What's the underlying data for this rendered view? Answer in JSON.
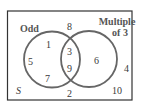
{
  "diagram": {
    "type": "venn",
    "universe_label": "S",
    "sets": [
      {
        "name": "Odd",
        "label": "Odd"
      },
      {
        "name": "Multiple of 3",
        "label_line1": "Multiple",
        "label_line2": "of 3"
      }
    ],
    "regions": {
      "odd_only": [
        "1",
        "5",
        "7"
      ],
      "both": [
        "3",
        "9"
      ],
      "multiple_of_3_only": [
        "6"
      ],
      "neither": [
        "8",
        "4",
        "2",
        "10"
      ]
    },
    "colors": {
      "outline": "#555555",
      "text": "#3a3a3a"
    }
  }
}
